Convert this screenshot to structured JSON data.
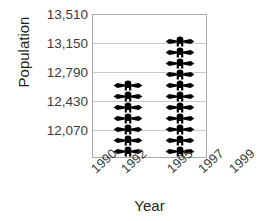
{
  "chart_data": {
    "type": "bar",
    "subtype": "pictograph",
    "title": "",
    "xlabel": "Year",
    "ylabel": "Population",
    "categories": [
      "1990",
      "1992",
      "1995",
      "1997",
      "1999"
    ],
    "x": [
      1990,
      1992,
      1995,
      1997,
      1999
    ],
    "values": [
      null,
      12790,
      13150,
      null,
      null
    ],
    "series": [
      {
        "name": "Population",
        "points": [
          {
            "category": "1992",
            "value": 12790,
            "symbol_count": 7
          },
          {
            "category": "1995",
            "value": 13150,
            "symbol_count": 11
          }
        ]
      }
    ],
    "ytick_labels": [
      "13,510",
      "13,150",
      "12,790",
      "12,430",
      "12,070"
    ],
    "ytick_values": [
      13510,
      13150,
      12790,
      12430,
      12070
    ],
    "ylim": [
      11890,
      13510
    ],
    "ytick_step": 360,
    "xtick_labels": [
      "1990",
      "1992",
      "1995",
      "1997",
      "1999"
    ],
    "grid": true,
    "legend": false,
    "symbol": "person-icon",
    "symbol_color": "#000000",
    "gridline_color": "#c9c9c9",
    "frame_color": "#a8a8a8",
    "text_color": "#3b3b3b",
    "background": "#ffffff"
  }
}
